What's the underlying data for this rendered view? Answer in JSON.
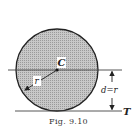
{
  "figure": {
    "caption": "Fig. 9.10",
    "labels": {
      "center": "C",
      "radius": "r",
      "distance": "d=r",
      "tangent": "T"
    },
    "colors": {
      "circle_fill": "#bdbdbd",
      "line": "#333333",
      "background": "#ffffff"
    }
  }
}
